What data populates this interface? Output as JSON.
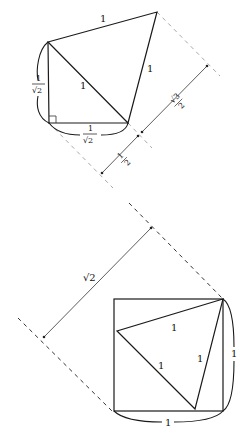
{
  "diagram": {
    "top_figure": {
      "description": "Right isosceles triangle with legs 1/sqrt(2) and hypotenuse 1, with an equilateral triangle of side 1 built on the hypotenuse; a dimension line shows projections 1/2 and sqrt(3)/2",
      "labels": {
        "top_edge": "1",
        "right_edge": "1",
        "hypotenuse": "1",
        "left_leg_num": "1",
        "left_leg_den": "√2",
        "bottom_leg_num": "1",
        "bottom_leg_den": "√2",
        "dim_upper_num": "√3",
        "dim_upper_den": "2",
        "dim_lower_num": "1",
        "dim_lower_den": "2"
      },
      "right_angle_marker": true,
      "dashed_color": "#a8a8a8"
    },
    "bottom_figure": {
      "description": "Unit square with an inscribed equilateral triangle of side 1 anchored at the top-right corner; diagonal dimension line of length sqrt(2)",
      "labels": {
        "diagonal": "√2",
        "triangle_top": "1",
        "triangle_right": "1",
        "triangle_left": "1",
        "square_right_brace": "1",
        "square_bottom_brace": "1"
      },
      "dashed_color": "#333333"
    },
    "stroke_color": "#1a1a1a"
  }
}
